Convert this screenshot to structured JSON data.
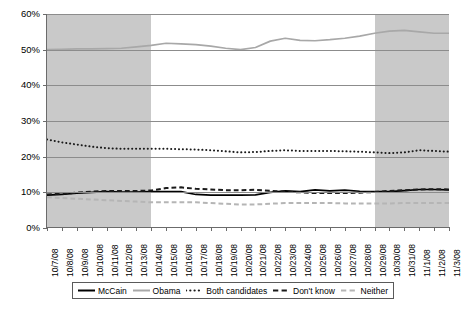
{
  "chart_data": {
    "type": "line",
    "title": "",
    "xlabel": "",
    "ylabel": "",
    "ylim": [
      0,
      60
    ],
    "ytick_labels": [
      "60%",
      "50%",
      "40%",
      "30%",
      "20%",
      "10%",
      "0%"
    ],
    "ytick_values": [
      60,
      50,
      40,
      30,
      20,
      10,
      0
    ],
    "grid": true,
    "legend_position": "bottom",
    "categories": [
      "10/7/08",
      "10/8/08",
      "10/9/08",
      "10/10/08",
      "10/11/08",
      "10/12/08",
      "10/13/08",
      "10/14/08",
      "10/15/08",
      "10/16/08",
      "10/17/08",
      "10/18/08",
      "10/19/08",
      "10/20/08",
      "10/21/08",
      "10/22/08",
      "10/23/08",
      "10/24/08",
      "10/25/08",
      "10/26/08",
      "10/27/08",
      "10/28/08",
      "10/29/08",
      "10/30/08",
      "10/31/08",
      "11/1/08",
      "11/2/08",
      "11/3/08"
    ],
    "shaded_bands": [
      {
        "from": "10/7/08",
        "to": "10/14/08",
        "color": "#c9c9c9"
      },
      {
        "from": "10/29/08",
        "to": "11/3/08",
        "color": "#c9c9c9"
      }
    ],
    "series": [
      {
        "name": "McCain",
        "color": "#000000",
        "style": "solid",
        "values": [
          9.2,
          9.4,
          9.8,
          10.0,
          10.2,
          10.1,
          10.1,
          10.2,
          10.2,
          10.2,
          9.4,
          9.2,
          9.2,
          9.2,
          9.3,
          10.0,
          10.4,
          10.2,
          10.7,
          10.4,
          10.6,
          10.3,
          10.2,
          10.2,
          10.5,
          10.8,
          10.8,
          10.7
        ]
      },
      {
        "name": "Obama",
        "color": "#a8a8a8",
        "style": "solid",
        "values": [
          50.0,
          50.1,
          50.2,
          50.2,
          50.3,
          50.4,
          50.8,
          51.2,
          51.8,
          51.6,
          51.4,
          51.0,
          50.4,
          50.0,
          50.6,
          52.4,
          53.2,
          52.6,
          52.5,
          52.8,
          53.2,
          53.8,
          54.6,
          55.2,
          55.4,
          55.0,
          54.6,
          54.6
        ]
      },
      {
        "name": "Both candidates",
        "color": "#1a1a1a",
        "style": "dotted",
        "values": [
          24.8,
          24.0,
          23.4,
          22.8,
          22.4,
          22.2,
          22.2,
          22.2,
          22.2,
          22.1,
          22.0,
          21.8,
          21.5,
          21.2,
          21.3,
          21.6,
          21.8,
          21.6,
          21.6,
          21.6,
          21.5,
          21.4,
          21.2,
          21.0,
          21.2,
          21.8,
          21.6,
          21.4
        ]
      },
      {
        "name": "Don't know",
        "color": "#1a1a1a",
        "style": "dashed",
        "values": [
          9.4,
          9.6,
          9.9,
          10.2,
          10.4,
          10.4,
          10.4,
          10.5,
          11.2,
          11.4,
          11.0,
          10.8,
          10.6,
          10.6,
          10.7,
          10.4,
          10.2,
          10.0,
          9.8,
          9.8,
          9.8,
          9.9,
          10.1,
          10.4,
          10.6,
          10.8,
          10.9,
          10.8
        ]
      },
      {
        "name": "Neither",
        "color": "#b5b5b5",
        "style": "dashed",
        "values": [
          8.6,
          8.4,
          8.2,
          8.0,
          7.8,
          7.6,
          7.4,
          7.2,
          7.2,
          7.2,
          7.2,
          7.0,
          6.8,
          6.6,
          6.6,
          6.8,
          7.0,
          7.0,
          7.0,
          7.0,
          6.9,
          6.9,
          6.9,
          6.9,
          7.0,
          7.0,
          7.0,
          7.0
        ]
      }
    ]
  },
  "legend": {
    "items": [
      {
        "label": "McCain"
      },
      {
        "label": "Obama"
      },
      {
        "label": "Both candidates"
      },
      {
        "label": "Don't know"
      },
      {
        "label": "Neither"
      }
    ]
  }
}
